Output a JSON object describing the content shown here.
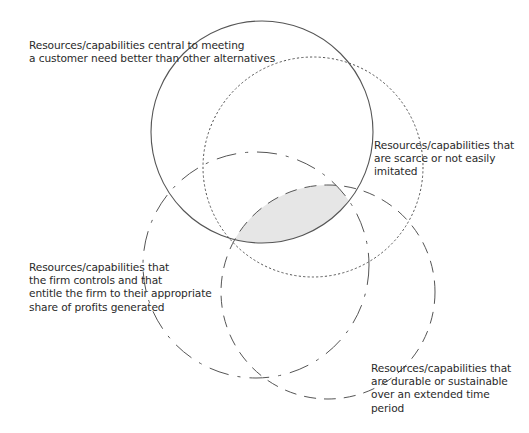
{
  "diagram": {
    "type": "venn",
    "sets": [
      {
        "id": "a",
        "label": "Resources/capabilities central to meeting\na customer need better than other alternatives",
        "stroke": "solid"
      },
      {
        "id": "b",
        "label": "Resources/capabilities that\nare scarce or not easily\nimitated",
        "stroke": "dotted"
      },
      {
        "id": "c",
        "label": "Resources/capabilities that\nthe firm controls and that\nentitle the firm to their appropriate\nshare of profits generated",
        "stroke": "long-dash-dot"
      },
      {
        "id": "d",
        "label": "Resources/capabilities that\nare durable or sustainable\nover an extended time\nperiod",
        "stroke": "dashed"
      }
    ],
    "highlight": {
      "region": "intersection of all four sets",
      "fill": "#e6e6e6"
    },
    "colors": {
      "stroke": "#555555",
      "text": "#2a2a2a",
      "background": "#ffffff"
    }
  }
}
